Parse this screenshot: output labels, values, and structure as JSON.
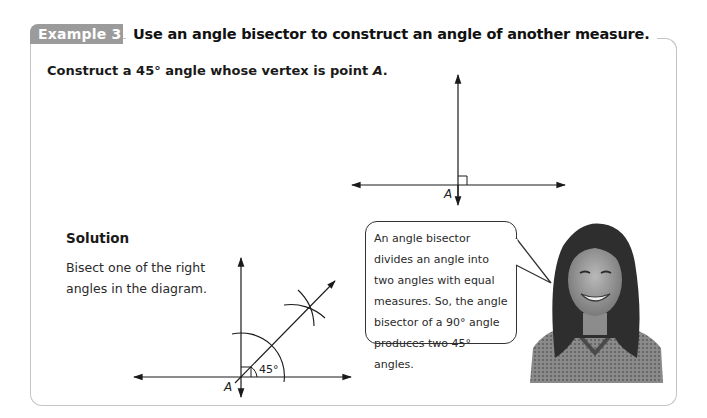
{
  "example": {
    "tab_label": "Example 3",
    "heading": "Use an angle bisector to construct an angle of another measure."
  },
  "problem": {
    "text_prefix": "Construct a 45° angle whose vertex is point ",
    "point": "A",
    "suffix": "."
  },
  "diagram_top": {
    "vertex_label": "A",
    "description": "Two perpendicular lines meeting at point A with a right-angle marker"
  },
  "solution": {
    "title": "Solution",
    "text": "Bisect one of the right angles in the diagram."
  },
  "diagram_bottom": {
    "vertex_label": "A",
    "angle_label": "45°",
    "description": "Perpendicular lines at A with an arc, intersecting arcs, and a bisector ray forming a 45° angle"
  },
  "speech_bubble": {
    "text": "An angle bisector divides an angle into two angles with equal measures. So, the angle bisector of a 90° angle produces two 45° angles."
  },
  "photo": {
    "description": "smiling student with long hair"
  },
  "colors": {
    "tab_bg": "#9b9b9b",
    "box_border": "#c4c4c4",
    "line": "#1a1a1a"
  }
}
